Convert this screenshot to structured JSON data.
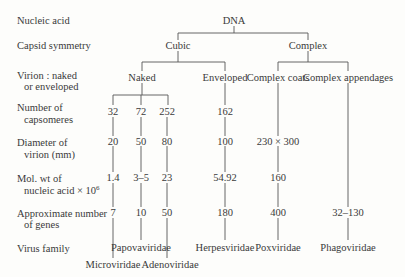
{
  "row_labels": {
    "nucleic_acid": "Nucleic acid",
    "capsid_symmetry": "Capsid symmetry",
    "virion_1": "Virion : naked",
    "virion_2": "or enveloped",
    "capsomeres_1": "Number of",
    "capsomeres_2": "capsomeres",
    "diameter_1": "Diameter of",
    "diameter_2": "virion (mm)",
    "molwt_1": "Mol. wt of",
    "molwt_2": "nucleic acid × 10",
    "molwt_exp": "6",
    "genes_1": "Approximate  number",
    "genes_2": "of genes",
    "family": "Virus family"
  },
  "tree": {
    "root": "DNA",
    "symmetry": {
      "cubic": "Cubic",
      "complex": "Complex"
    },
    "virion": {
      "naked": "Naked",
      "enveloped": "Enveloped",
      "complex_coats": "Complex coats",
      "complex_appendages": "Complex appendages"
    }
  },
  "columns": {
    "microviridae": {
      "capsomeres": "32",
      "diameter": "20",
      "molwt": "1.4",
      "genes": "7",
      "family": "Microviridae"
    },
    "papovaviridae": {
      "capsomeres": "72",
      "diameter": "50",
      "molwt": "3–5",
      "genes": "10",
      "family": "Papovaviridae"
    },
    "adenoviridae": {
      "capsomeres": "252",
      "diameter": "80",
      "molwt": "23",
      "genes": "50",
      "family": "Adenoviridae"
    },
    "herpesviridae": {
      "capsomeres": "162",
      "diameter": "100",
      "molwt": "54.92",
      "genes": "180",
      "family": "Herpesviridae"
    },
    "poxviridae": {
      "diameter": "230 × 300",
      "molwt": "160",
      "genes": "400",
      "family": "Poxviridae"
    },
    "phagoviridae": {
      "genes": "32–130",
      "family": "Phagoviridae"
    }
  }
}
